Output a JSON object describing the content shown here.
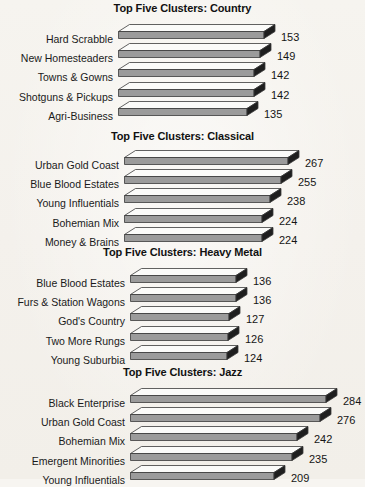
{
  "page": {
    "background_color": "#f5f2ec",
    "bar_top_color": "#fbfbf9",
    "bar_front_color": "#9b9b9b",
    "bar_cap_color": "#1e1e1e",
    "bar_outline_color": "#3a3a3a",
    "text_color": "#1a1a1a"
  },
  "chart_data": [
    {
      "type": "bar",
      "orientation": "horizontal",
      "title": "Top Five Clusters: Country",
      "xlabel": "",
      "ylabel": "",
      "grid": false,
      "legend": "none",
      "categories": [
        "Hard Scrabble",
        "New Homesteaders",
        "Towns & Gowns",
        "Shotguns & Pickups",
        "Agri-Business"
      ],
      "values": [
        153,
        149,
        142,
        142,
        135
      ],
      "value_labels": [
        "153",
        "149",
        "142",
        "142",
        "135"
      ],
      "xlim": [
        0,
        153
      ]
    },
    {
      "type": "bar",
      "orientation": "horizontal",
      "title": "Top Five Clusters: Classical",
      "xlabel": "",
      "ylabel": "",
      "grid": false,
      "legend": "none",
      "categories": [
        "Urban Gold Coast",
        "Blue Blood Estates",
        "Young Influentials",
        "Bohemian Mix",
        "Money & Brains"
      ],
      "values": [
        267,
        255,
        238,
        224,
        224
      ],
      "value_labels": [
        "267",
        "255",
        "238",
        "224",
        "224"
      ],
      "xlim": [
        0,
        267
      ]
    },
    {
      "type": "bar",
      "orientation": "horizontal",
      "title": "Top Five Clusters: Heavy Metal",
      "xlabel": "",
      "ylabel": "",
      "grid": false,
      "legend": "none",
      "categories": [
        "Blue Blood Estates",
        "Furs & Station Wagons",
        "God's Country",
        "Two More Rungs",
        "Young Suburbia"
      ],
      "values": [
        136,
        136,
        127,
        126,
        124
      ],
      "value_labels": [
        "136",
        "136",
        "127",
        "126",
        "124"
      ],
      "xlim": [
        0,
        136
      ]
    },
    {
      "type": "bar",
      "orientation": "horizontal",
      "title": "Top Five Clusters: Jazz",
      "xlabel": "",
      "ylabel": "",
      "grid": false,
      "legend": "none",
      "categories": [
        "Black Enterprise",
        "Urban Gold Coast",
        "Bohemian Mix",
        "Emergent Minorities",
        "Young Influentials"
      ],
      "values": [
        284,
        276,
        242,
        235,
        209
      ],
      "value_labels": [
        "284",
        "276",
        "242",
        "235",
        "209"
      ],
      "xlim": [
        0,
        284
      ]
    }
  ],
  "layout": {
    "panels": [
      {
        "top": 0,
        "title_top": 2,
        "rows_top": 24,
        "row_pitch": 19.2,
        "bar_x": 118,
        "bar_max_w": 146,
        "label_right": 113
      },
      {
        "top": 128,
        "title_top": 130,
        "rows_top": 150,
        "row_pitch": 19.2,
        "bar_x": 124,
        "bar_max_w": 164,
        "label_right": 119
      },
      {
        "top": 244,
        "title_top": 246,
        "rows_top": 268,
        "row_pitch": 19.2,
        "bar_x": 130,
        "bar_max_w": 106,
        "label_right": 125
      },
      {
        "top": 364,
        "title_top": 366,
        "rows_top": 388,
        "row_pitch": 19.2,
        "bar_x": 130,
        "bar_max_w": 196,
        "label_right": 125
      }
    ]
  }
}
